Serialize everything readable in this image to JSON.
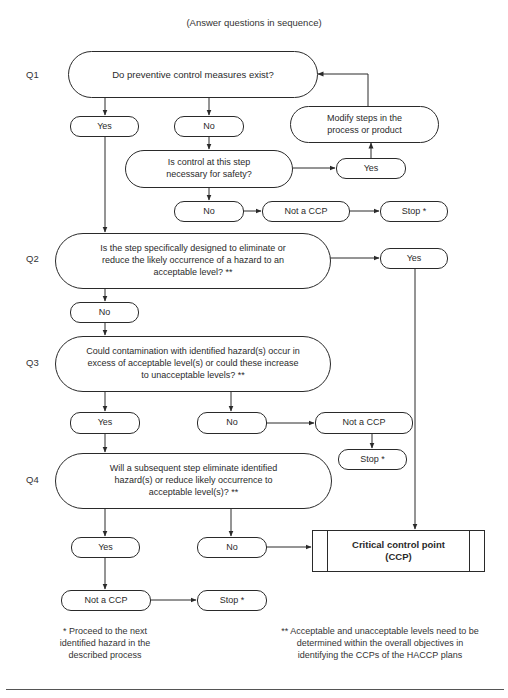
{
  "header": "(Answer questions in sequence)",
  "questions": {
    "q1": {
      "label": "Q1",
      "text": "Do preventive control measures exist?"
    },
    "q2": {
      "label": "Q2",
      "text": "Is the step specifically designed to eliminate or reduce the likely occurrence of a hazard to an acceptable level? **"
    },
    "q3": {
      "label": "Q3",
      "text": "Could contamination with identified hazard(s) occur in excess of acceptable level(s) or could these increase to unacceptable levels? **"
    },
    "q4": {
      "label": "Q4",
      "text": "Will a subsequent step eliminate identified hazard(s) or reduce likely occurrence to acceptable level(s)? **"
    }
  },
  "q1_branch": {
    "yes": "Yes",
    "no": "No",
    "control_question": "Is control at this step necessary for safety?",
    "control_yes": "Yes",
    "modify": "Modify steps in the process or product",
    "control_no": "No",
    "not_ccp": "Not a CCP",
    "stop": "Stop *"
  },
  "q2_branch": {
    "yes": "Yes",
    "no": "No"
  },
  "q3_branch": {
    "yes": "Yes",
    "no": "No",
    "not_ccp": "Not a CCP",
    "stop": "Stop *"
  },
  "q4_branch": {
    "yes": "Yes",
    "no": "No",
    "not_ccp": "Not a CCP",
    "stop": "Stop *"
  },
  "ccp": {
    "line1": "Critical control point",
    "line2": "(CCP)"
  },
  "footnotes": {
    "single": "* Proceed to the next identified hazard in the described process",
    "double": "** Acceptable and unacceptable levels need to be determined within the overall objectives in identifying the CCPs of the HACCP plans"
  },
  "colors": {
    "line": "#2a2a2a",
    "background": "#ffffff"
  }
}
